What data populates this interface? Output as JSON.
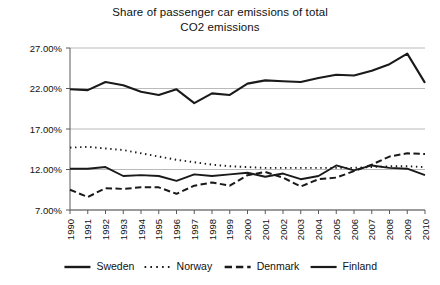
{
  "chart_data": {
    "type": "line",
    "title": "Share of passenger car emissions of total CO2 emissions",
    "title_line1": "Share of passenger car emissions of total",
    "title_line2": "CO2 emissions",
    "xlabel": "",
    "ylabel": "",
    "grid": true,
    "legend_position": "bottom",
    "ylim": [
      7,
      27
    ],
    "ytick_labels": [
      "27.00%",
      "22.00%",
      "17.00%",
      "12.00%",
      "7.00%"
    ],
    "ytick_values": [
      27,
      22,
      17,
      12,
      7
    ],
    "categories": [
      "1990",
      "1991",
      "1992",
      "1993",
      "1994",
      "1995",
      "1996",
      "1997",
      "1998",
      "1999",
      "2000",
      "2001",
      "2002",
      "2003",
      "2004",
      "2005",
      "2006",
      "2007",
      "2008",
      "2009",
      "2010"
    ],
    "series": [
      {
        "name": "Sweden",
        "style": "solid",
        "width": 2.1,
        "values": [
          21.9,
          21.8,
          22.8,
          22.4,
          21.6,
          21.2,
          21.9,
          20.2,
          21.4,
          21.2,
          22.6,
          23.0,
          22.9,
          22.8,
          23.3,
          23.7,
          23.6,
          24.2,
          25.0,
          26.3,
          22.7
        ]
      },
      {
        "name": "Norway",
        "style": "dotted",
        "width": 1.9,
        "values": [
          14.7,
          14.8,
          14.6,
          14.4,
          14.0,
          13.6,
          13.2,
          12.9,
          12.6,
          12.4,
          12.3,
          12.2,
          12.2,
          12.2,
          12.2,
          12.2,
          12.2,
          12.3,
          12.4,
          12.4,
          12.3
        ]
      },
      {
        "name": "Denmark",
        "style": "dashed",
        "width": 2.0,
        "values": [
          9.5,
          8.6,
          9.7,
          9.6,
          9.8,
          9.8,
          9.0,
          10.0,
          10.4,
          10.0,
          11.3,
          11.7,
          11.0,
          9.9,
          10.8,
          11.0,
          11.8,
          12.6,
          13.6,
          14.0,
          13.9
        ]
      },
      {
        "name": "Finland",
        "style": "solid",
        "width": 1.9,
        "values": [
          12.1,
          12.1,
          12.3,
          11.2,
          11.3,
          11.2,
          10.6,
          11.4,
          11.2,
          11.4,
          11.6,
          11.1,
          11.5,
          10.8,
          11.2,
          12.5,
          11.9,
          12.5,
          12.2,
          12.1,
          11.3
        ]
      }
    ]
  },
  "legend": {
    "items": [
      {
        "label": "Sweden",
        "style": "solid"
      },
      {
        "label": "Norway",
        "style": "dotted"
      },
      {
        "label": "Denmark",
        "style": "dashed"
      },
      {
        "label": "Finland",
        "style": "solid"
      }
    ]
  }
}
